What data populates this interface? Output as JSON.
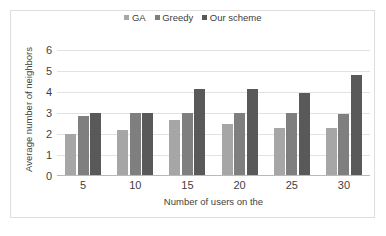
{
  "chart_data": {
    "type": "bar",
    "title": "",
    "xlabel": "Number of users on the",
    "ylabel": "Average number of neighbors",
    "categories": [
      "5",
      "10",
      "15",
      "20",
      "25",
      "30"
    ],
    "series": [
      {
        "name": "GA",
        "color": "#a6a6a6",
        "values": [
          2.0,
          2.17,
          2.65,
          2.5,
          2.3,
          2.3
        ]
      },
      {
        "name": "Greedy",
        "color": "#7f7f7f",
        "values": [
          2.85,
          3.0,
          3.0,
          3.0,
          3.0,
          2.97
        ]
      },
      {
        "name": "Our scheme",
        "color": "#595959",
        "values": [
          3.0,
          3.0,
          4.15,
          4.15,
          3.97,
          4.8
        ]
      }
    ],
    "ylim": [
      0,
      6
    ],
    "y_ticks": [
      "0",
      "1",
      "2",
      "3",
      "4",
      "5",
      "6"
    ],
    "grid": true,
    "legend_position": "top-center",
    "legend_marker": "square",
    "axis_line_color": "#b9b9b9",
    "gridline_color": "#e2e2e2",
    "frame_color": "#dedede",
    "background": "#ffffff"
  },
  "legend": {
    "items": [
      {
        "label": "GA"
      },
      {
        "label": "Greedy"
      },
      {
        "label": "Our scheme"
      }
    ]
  }
}
